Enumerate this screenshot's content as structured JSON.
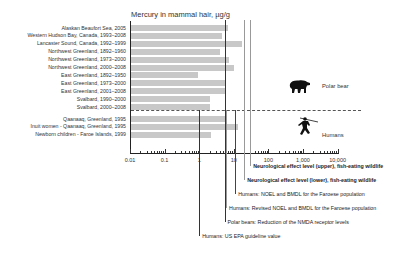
{
  "chart_data": {
    "type": "bar",
    "orientation": "horizontal",
    "title": "Mercury in mammal hair, µg/g",
    "xlabel": "",
    "ylabel": "",
    "xscale": "log",
    "xlim": [
      0.01,
      10000
    ],
    "x_tick_labels": [
      "0.01",
      "0.1",
      "1",
      "10",
      "100",
      "1,000",
      "10,000"
    ],
    "grid": false,
    "groups": [
      {
        "name": "Polar bear",
        "categories": [
          "Alaskan Beaufort Sea, 2005",
          "Western Hudson Bay, Canada, 1993–2008",
          "Lancaster Sound, Canada, 1992–1999",
          "Northwest Greenland, 1892–1960",
          "Northwest Greenland, 1973–2000",
          "Northwest Greenland, 2000–2008",
          "East Greenland, 1892–1950",
          "East Greenland, 1973–2000",
          "East Greenland, 2001–2008",
          "Svalbard, 1990–2000",
          "Svalbard, 2000–2008"
        ]
      },
      {
        "name": "Humans",
        "categories": [
          "Qaanaaq, Greenland, 1995",
          "Inuit women - Qaanaaq, Greenland, 1995",
          "Newborn children - Faroe Islands, 1999"
        ]
      }
    ],
    "categories": [
      "Alaskan Beaufort Sea, 2005",
      "Western Hudson Bay, Canada, 1993–2008",
      "Lancaster Sound, Canada, 1992–1999",
      "Northwest Greenland, 1892–1960",
      "Northwest Greenland, 1973–2000",
      "Northwest Greenland, 2000–2008",
      "East Greenland, 1892–1950",
      "East Greenland, 1973–2000",
      "East Greenland, 2001–2008",
      "Svalbard, 1990–2000",
      "Svalbard, 2000–2008",
      "Qaanaaq, Greenland, 1995",
      "Inuit women - Qaanaaq, Greenland, 1995",
      "Newborn children - Faroe Islands, 1999"
    ],
    "values": [
      7,
      4.5,
      17,
      4,
      7.5,
      10,
      0.95,
      5.5,
      6,
      2,
      2,
      5.5,
      13,
      2.2
    ],
    "reference_lines": [
      {
        "label": "Neurological effect level (upper), fish-eating wildlife",
        "value": 30,
        "bold": true
      },
      {
        "label": "Neurological effect level (lower), fish-eating wildlife",
        "value": 20,
        "bold": true
      },
      {
        "label": "Humans: NOEL and BMDL for the Faroese population",
        "value": 11
      },
      {
        "label": "Humans: Revised NOEL and BMDL for  the Faroese population",
        "value": 6
      },
      {
        "label": "Polar bears: Reduction of the NMDA receptor levels",
        "value": 5.4
      },
      {
        "label": "Humans: US EPA guideline value",
        "value": 1
      }
    ],
    "legend": [
      "Polar bear",
      "Humans"
    ]
  },
  "colors": {
    "bar": "#c8c8c8",
    "axis": "#222222",
    "ref_line_dark": "#333333",
    "ref_line_light": "#999999"
  }
}
